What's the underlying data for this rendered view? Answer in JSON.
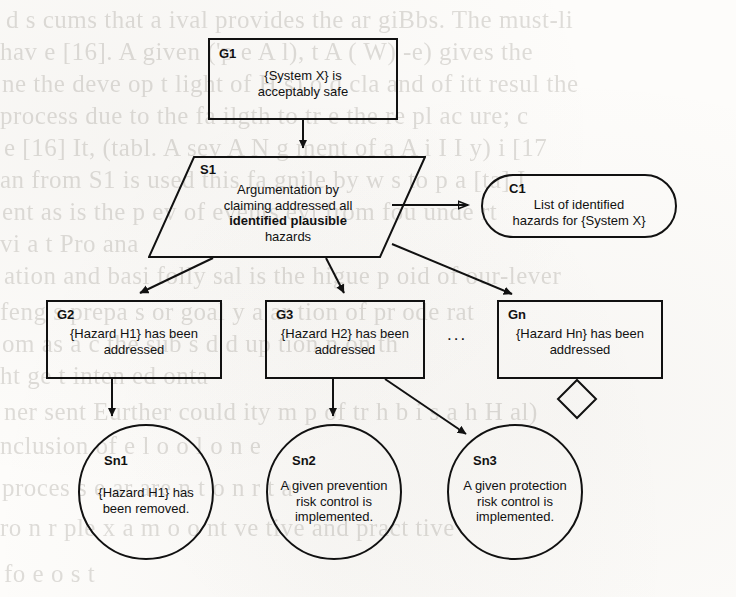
{
  "diagram": {
    "type": "gsn-safety-case",
    "notation": "Goal Structuring Notation",
    "ellipsis": "..."
  },
  "nodes": {
    "g1": {
      "id": "G1",
      "kind": "goal",
      "line1": "{System X} is",
      "line2": "acceptably safe"
    },
    "s1": {
      "id": "S1",
      "kind": "strategy",
      "line1": "Argumentation by",
      "line2": "claiming addressed all",
      "line3": "identified plausible",
      "line4": "hazards"
    },
    "c1": {
      "id": "C1",
      "kind": "context",
      "line1": "List of identified",
      "line2": "hazards for {System X}"
    },
    "g2": {
      "id": "G2",
      "kind": "goal",
      "line1": "{Hazard H1} has been",
      "line2": "addressed"
    },
    "g3": {
      "id": "G3",
      "kind": "goal",
      "line1": "{Hazard H2} has been",
      "line2": "addressed"
    },
    "gn": {
      "id": "Gn",
      "kind": "goal",
      "line1": "{Hazard Hn} has been",
      "line2": "addressed"
    },
    "sn1": {
      "id": "Sn1",
      "kind": "solution",
      "line1": "{Hazard H1} has",
      "line2": "been removed."
    },
    "sn2": {
      "id": "Sn2",
      "kind": "solution",
      "line1": "A given prevention",
      "line2": "risk control is",
      "line3": "implemented."
    },
    "sn3": {
      "id": "Sn3",
      "kind": "solution",
      "line1": "A given protection",
      "line2": "risk control is",
      "line3": "implemented."
    }
  },
  "background_text": {
    "lines": [
      "d s cums that a ival provides the ar giBbs. The must-li",
      "hav e [16]. A  given ('p e A l), t A ( W) -e) gives the",
      "ne the deve op t light of H s) o d cla and of itt resul the",
      "process due to the fa ilgth to tr e the re pl ac ure; c",
      "e [16] It, (tabl. A sev A N g  ment of a  A i I I y) i [17",
      "an from S1 is used this fa gnile by w s to p a [ta] I",
      "ent as is the p ev of events evi from fou  unde rt",
      "vi  a  t  Pro  ana",
      "ation  and basi folly  sal  is  the  higue  p oid  of  our-lever",
      "feng  s  prepa  s  or  goal  y  a  ar  tion  of  pr  ode  rat",
      "om  as  a  c  the  sub  s  d  d  up  tion  n  on  th",
      "ht  ge  t  inten  ed  onta",
      "ner sent Eurther could  ity  m p  of  tr  h  b  i  s  a  h  H al)",
      "nclusion of e l o o l o n e",
      "proces  s  e  ar  are  n  t  o  n  r  t  a",
      "ro  n  r  ple  x  a  m  o  o  nt  ve  tive  and  pract  tive",
      "fo  e  o  s  t"
    ]
  }
}
